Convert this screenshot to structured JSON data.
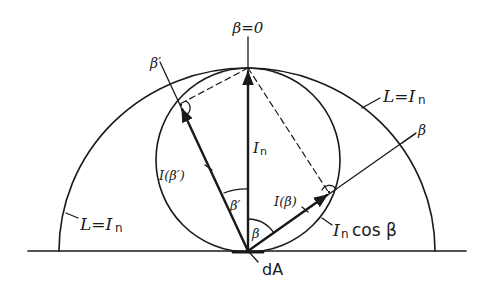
{
  "diagram": {
    "type": "lambertian-emitter-intensity-diagram",
    "labels": {
      "normal_axis": "β=0",
      "beta_prime_ray": "β′",
      "beta_ray": "β",
      "radiance_right": "L=I",
      "radiance_right_sub": "n",
      "radiance_left": "L=I",
      "radiance_left_sub": "n",
      "normal_intensity": "I",
      "normal_intensity_sub": "n",
      "intensity_beta_prime": "I(β′)",
      "intensity_beta": "I(β)",
      "angle_beta_prime": "β′",
      "angle_beta": "β",
      "cosine_law": "I",
      "cosine_law_sub": "n",
      "cosine_law_rest": "cos β",
      "area_element": "dA"
    },
    "colors": {
      "ink": "#1a1a1a",
      "background": "#ffffff"
    }
  }
}
